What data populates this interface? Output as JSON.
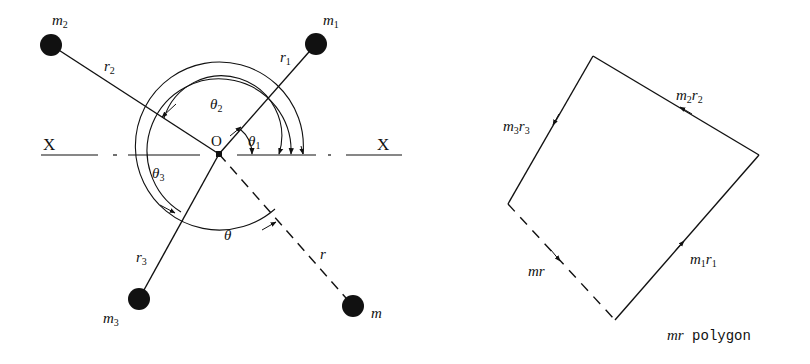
{
  "left_diagram": {
    "axis_labels": {
      "left": "X",
      "right": "X"
    },
    "origin_label": "O",
    "masses": [
      {
        "id": "m1",
        "label": "m",
        "sub": "1",
        "radius_label": "r",
        "radius_sub": "1",
        "angle_label": "θ",
        "angle_sub": "1"
      },
      {
        "id": "m2",
        "label": "m",
        "sub": "2",
        "radius_label": "r",
        "radius_sub": "2",
        "angle_label": "θ",
        "angle_sub": "2"
      },
      {
        "id": "m3",
        "label": "m",
        "sub": "3",
        "radius_label": "r",
        "radius_sub": "3",
        "angle_label": "θ",
        "angle_sub": "3"
      },
      {
        "id": "m",
        "label": "m",
        "sub": "",
        "radius_label": "r",
        "radius_sub": "",
        "angle_label": "θ",
        "angle_sub": ""
      }
    ]
  },
  "right_diagram": {
    "vectors": [
      {
        "id": "m1r1",
        "m": "m",
        "msub": "1",
        "r": "r",
        "rsub": "1"
      },
      {
        "id": "m2r2",
        "m": "m",
        "msub": "2",
        "r": "r",
        "rsub": "2"
      },
      {
        "id": "m3r3",
        "m": "m",
        "msub": "3",
        "r": "r",
        "rsub": "3"
      },
      {
        "id": "mr",
        "m": "m",
        "msub": "",
        "r": "r",
        "rsub": ""
      }
    ],
    "caption_italic": "mr",
    "caption_text": " polygon"
  },
  "colors": {
    "ink": "#111111",
    "background": "#ffffff"
  }
}
